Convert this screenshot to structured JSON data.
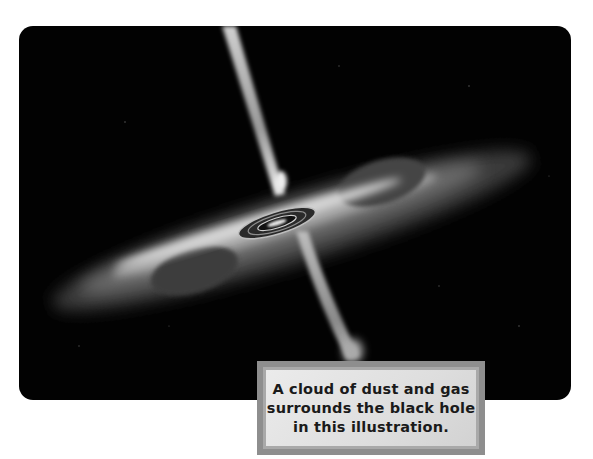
{
  "illustration": {
    "subject": "black-hole-illustration",
    "description": "Black hole with accretion disk and bipolar jets"
  },
  "caption": {
    "lines": [
      "A cloud of dust and gas",
      "surrounds the black hole",
      "in this illustration."
    ]
  },
  "colors": {
    "background": "#ffffff",
    "space": "#020202",
    "caption_border_outer": "#8e8e8e",
    "caption_border_inner": "#a9a9a9",
    "caption_fill": "#e4e4e4",
    "caption_text": "#1a1a1a"
  }
}
